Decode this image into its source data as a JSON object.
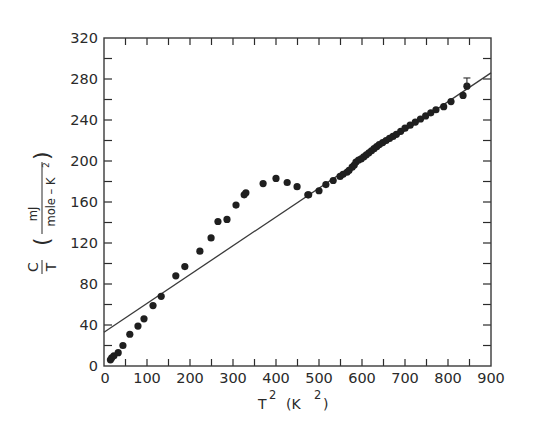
{
  "chart_data": {
    "type": "scatter",
    "title": "",
    "xlabel": "T² (K²)",
    "ylabel": "C/T (mJ / mole-K²)",
    "xlabel_parts": {
      "symbol": "T",
      "sup": "2",
      "unit_open": "(K",
      "unit_sup": "2",
      "unit_close": ")"
    },
    "ylabel_parts": {
      "numerator": "C",
      "denominator": "T",
      "unit_numerator": "mJ",
      "unit_denominator": "mole – K",
      "unit_sup": "2"
    },
    "xlim": [
      0,
      900
    ],
    "ylim": [
      0,
      320
    ],
    "x_ticks": [
      0,
      100,
      200,
      300,
      400,
      500,
      600,
      700,
      800,
      900
    ],
    "x_tick_labels": [
      "0",
      "100",
      "200",
      "300",
      "400",
      "500",
      "600",
      "700",
      "800",
      "900"
    ],
    "y_ticks": [
      0,
      40,
      80,
      120,
      160,
      200,
      240,
      280,
      320
    ],
    "y_tick_labels": [
      "0",
      "40",
      "80",
      "120",
      "160",
      "200",
      "240",
      "280",
      "320"
    ],
    "x_minor_step": 50,
    "y_minor_step": 20,
    "grid": false,
    "legend": null,
    "series": [
      {
        "name": "measured C/T",
        "kind": "points",
        "x": [
          15,
          18,
          23,
          33,
          44,
          60,
          79,
          93,
          114,
          133,
          167,
          188,
          223,
          249,
          265,
          286,
          307,
          326,
          330,
          370,
          400,
          426,
          449,
          474,
          476,
          500,
          516,
          533,
          549,
          556,
          565,
          570,
          577,
          582,
          586,
          592,
          598,
          604,
          610,
          616,
          622,
          628,
          634,
          640,
          648,
          656,
          664,
          672,
          680,
          690,
          700,
          712,
          724,
          736,
          748,
          760,
          772,
          790,
          807,
          835,
          844
        ],
        "y": [
          6,
          8,
          10,
          13,
          20,
          31,
          39,
          46,
          59,
          68,
          88,
          97,
          112,
          125,
          141,
          143,
          157,
          167,
          169,
          178,
          183,
          179,
          175,
          167,
          167,
          171,
          177,
          181,
          185,
          187,
          189,
          191,
          194,
          196,
          199,
          201,
          202,
          204,
          206,
          208,
          210,
          212,
          214,
          216,
          218,
          220,
          222,
          224,
          226,
          229,
          232,
          235,
          238,
          241,
          244,
          247,
          250,
          253,
          258,
          264,
          273
        ]
      },
      {
        "name": "linear fit",
        "kind": "line",
        "intercept": 33,
        "slope": 0.281,
        "x": [
          0,
          900
        ],
        "y": [
          33,
          286
        ]
      }
    ],
    "annotations": [
      {
        "type": "error_bar",
        "x": 844,
        "y": 273,
        "upper": 281,
        "description": "error bar on highest data point"
      }
    ]
  }
}
